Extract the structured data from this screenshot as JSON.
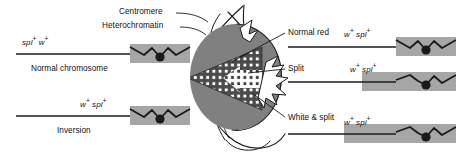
{
  "figure": {
    "colors": {
      "heterochromatin_band": "#a6a6a6",
      "eye_red_region": "#808080",
      "wedge_dark": "#4d4d4d",
      "white_patch": "#ffffff",
      "line": "#1a1a1a",
      "centromere": "#1a1a1a",
      "background": "#ffffff"
    },
    "annotations": {
      "centromere": "Centromere",
      "heterochromatin": "Heterochromatin"
    },
    "left_chromosomes": [
      {
        "id": "normal-chromosome",
        "genotype_prefix": "spl",
        "genotype": "spl+ w+",
        "caption": "Normal chromosome"
      },
      {
        "id": "inversion-chromosome",
        "genotype": "w+ spl+",
        "caption": "Inversion"
      }
    ],
    "eye_callouts": [
      {
        "id": "normal-red",
        "label": "Normal red",
        "genotype": "w+ spl+"
      },
      {
        "id": "split",
        "label": "Split",
        "genotype": "w+ spl+"
      },
      {
        "id": "white-and-split",
        "label": "White & split",
        "genotype": "w+ spl+"
      }
    ]
  }
}
